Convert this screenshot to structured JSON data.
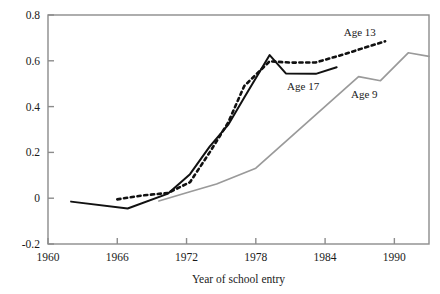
{
  "chart_data": {
    "type": "line",
    "title": "",
    "subtitle": "",
    "xlabel": "Year of school entry",
    "ylabel": "",
    "xlim": [
      1960,
      1993
    ],
    "ylim": [
      -0.2,
      0.8
    ],
    "grid": false,
    "legend_position": "inline-annotations",
    "xticks": [
      "1960",
      "1966",
      "1972",
      "1978",
      "1984",
      "1990"
    ],
    "xtick_values": [
      1960,
      1966,
      1972,
      1978,
      1984,
      1990
    ],
    "yticks": [
      "0.8",
      "0.6",
      "0.4",
      "0.2",
      "0",
      "-0.2"
    ],
    "ytick_values": [
      0.8,
      0.6,
      0.4,
      0.2,
      0,
      -0.2
    ],
    "series": [
      {
        "name": "Age 17",
        "style": "solid",
        "color": "#111111",
        "width": 2,
        "label_x": 1982.1,
        "label_y": 0.49,
        "x": [
          1962.0,
          1966.9,
          1970.4,
          1972.3,
          1974.0,
          1975.6,
          1977.0,
          1979.2,
          1980.6,
          1983.2,
          1985.0
        ],
        "y": [
          -0.015,
          -0.045,
          0.02,
          0.105,
          0.225,
          0.32,
          0.44,
          0.625,
          0.545,
          0.543,
          0.572
        ]
      },
      {
        "name": "Age 13",
        "style": "dotted",
        "color": "#111111",
        "width": 2.6,
        "label_x": 1987.0,
        "label_y": 0.725,
        "x": [
          1966.0,
          1968.2,
          1970.4,
          1972.3,
          1974.0,
          1975.6,
          1977.0,
          1979.2,
          1981.0,
          1983.2,
          1985.6,
          1987.6,
          1989.2
        ],
        "y": [
          -0.005,
          0.012,
          0.023,
          0.07,
          0.2,
          0.33,
          0.49,
          0.598,
          0.592,
          0.593,
          0.628,
          0.66,
          0.685
        ]
      },
      {
        "name": "Age 9",
        "style": "solid",
        "color": "#9a9a9a",
        "width": 1.7,
        "label_x": 1987.4,
        "label_y": 0.455,
        "x": [
          1969.6,
          1972.3,
          1974.6,
          1978.0,
          1986.9,
          1988.8,
          1991.2,
          1993.0
        ],
        "y": [
          -0.012,
          0.028,
          0.062,
          0.131,
          0.531,
          0.513,
          0.635,
          0.619
        ]
      }
    ]
  },
  "axes": {
    "frame_color": "#8c8c8c"
  }
}
